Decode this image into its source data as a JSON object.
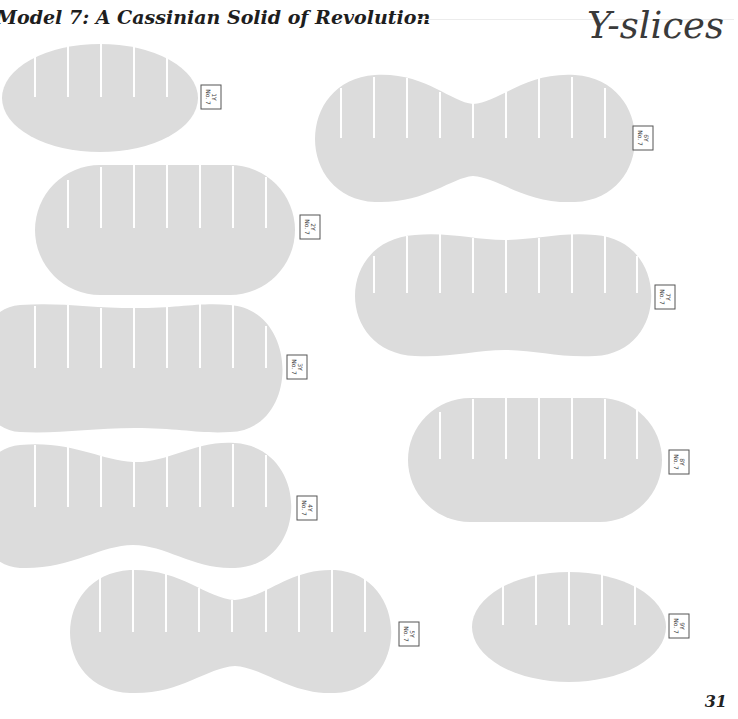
{
  "header": {
    "title": "Model 7: A Cassinian Solid of Revolution",
    "section": "Y-slices"
  },
  "footer": {
    "page_number": "31"
  },
  "slices": [
    {
      "id": "1Y",
      "model": "No. 7",
      "shape": "oval",
      "slits": 5
    },
    {
      "id": "2Y",
      "model": "No. 7",
      "shape": "oval",
      "slits": 7
    },
    {
      "id": "3Y",
      "model": "No. 7",
      "shape": "slight-waist",
      "slits": 8
    },
    {
      "id": "4Y",
      "model": "No. 7",
      "shape": "waisted",
      "slits": 8
    },
    {
      "id": "5Y",
      "model": "No. 7",
      "shape": "peanut",
      "slits": 9
    },
    {
      "id": "6Y",
      "model": "No. 7",
      "shape": "peanut",
      "slits": 9
    },
    {
      "id": "7Y",
      "model": "No. 7",
      "shape": "slight-waist",
      "slits": 8
    },
    {
      "id": "8Y",
      "model": "No. 7",
      "shape": "oval",
      "slits": 7
    },
    {
      "id": "9Y",
      "model": "No. 7",
      "shape": "oval",
      "slits": 5
    }
  ],
  "colors": {
    "slice_fill": "#dcdcdc",
    "slit": "#ffffff",
    "text": "#1e1e1e"
  }
}
